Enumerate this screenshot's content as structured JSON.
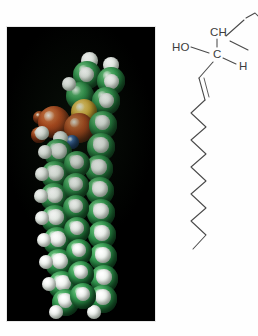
{
  "figure": {
    "kind": "two-panel-chemistry-figure",
    "background_color": "#ffffff"
  },
  "photo_panel": {
    "name": "space-filling-molecular-model-photograph",
    "background_color": "#000000",
    "caption": "",
    "model": {
      "representation": "space-filling",
      "description": "Hairpin-folded lipid molecule with polar head group at top and two hydrocarbon tails descending",
      "atom_color_key": [
        {
          "element": "C",
          "label": "carbon",
          "color": "#2f9a4c"
        },
        {
          "element": "H",
          "label": "hydrogen",
          "color": "#f4f7f4"
        },
        {
          "element": "O",
          "label": "oxygen",
          "color": "#b9471c"
        },
        {
          "element": "P",
          "label": "phosphorus",
          "color": "#e3b238"
        },
        {
          "element": "N",
          "label": "nitrogen",
          "color": "#24509e"
        }
      ]
    }
  },
  "structure_panel": {
    "name": "skeletal-structural-formula",
    "clipped_at_right_edge": true,
    "labels": {
      "hydroxyl": "HO",
      "methine": "CH",
      "carbon": "C",
      "hydrogen": "H"
    },
    "features": {
      "double_bond": "trans carbon-carbon double bond below the head group",
      "chain": "long saturated zigzag hydrocarbon chain"
    }
  },
  "colors": {
    "photo_background": "#000000",
    "page_background": "#ffffff",
    "line_stroke": "#4a4a4a",
    "text": "#3c3c3c"
  }
}
